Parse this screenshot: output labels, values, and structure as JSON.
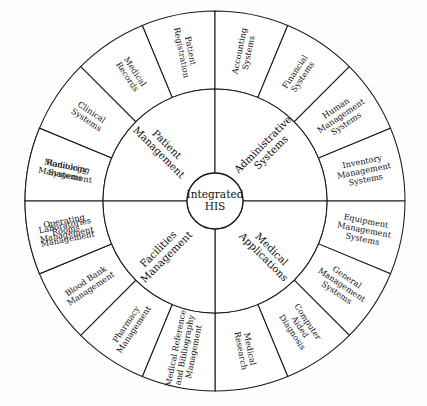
{
  "diagram": {
    "type": "radial-hierarchy-wheel",
    "hub": {
      "line1": "Integrated",
      "line2": "HIS"
    },
    "geometry": {
      "center_x": 215,
      "center_y": 201,
      "hub_radius": 28,
      "inner_ring_outer_radius": 112,
      "outer_ring_outer_radius": 190
    },
    "colors": {
      "stroke": "#1b1b1b",
      "fill": "#ffffff",
      "text": "#111111",
      "background": "#fdfdfc"
    },
    "inner_ring": [
      {
        "id": "patient-management",
        "label": "Patient Management",
        "lines": [
          "Patient",
          "Management"
        ],
        "start_angle": 180,
        "end_angle": 270
      },
      {
        "id": "administrative-systems",
        "label": "Administrative Systems",
        "lines": [
          "Administrative",
          "Systems"
        ],
        "start_angle": 270,
        "end_angle": 360
      },
      {
        "id": "medical-applications",
        "label": "Medical Applications",
        "lines": [
          "Medical",
          "Applications"
        ],
        "start_angle": 0,
        "end_angle": 90
      },
      {
        "id": "facilities-management",
        "label": "Facilities Management",
        "lines": [
          "Facilities",
          "Management"
        ],
        "start_angle": 90,
        "end_angle": 180
      }
    ],
    "outer_ring": [
      {
        "id": "patient-registration",
        "label": "Patient Registration",
        "lines": [
          "Patient",
          "Registration"
        ],
        "parent": "patient-management",
        "start_angle": 247.5,
        "end_angle": 270
      },
      {
        "id": "medical-records",
        "label": "Medical Records",
        "lines": [
          "Medical",
          "Records"
        ],
        "parent": "patient-management",
        "start_angle": 225,
        "end_angle": 247.5
      },
      {
        "id": "clinical-systems",
        "label": "Clinical Systems",
        "lines": [
          "Clinical",
          "Systems"
        ],
        "parent": "patient-management",
        "start_angle": 202.5,
        "end_angle": 225
      },
      {
        "id": "monitoring-systems",
        "label": "Monitoring Systems",
        "lines": [
          "Monitoring",
          "Systems"
        ],
        "parent": "patient-management",
        "start_angle": 180,
        "end_angle": 202.5
      },
      {
        "id": "accounting-systems",
        "label": "Accounting Systems",
        "lines": [
          "Accounting",
          "Systems"
        ],
        "parent": "administrative-systems",
        "start_angle": 270,
        "end_angle": 292.5
      },
      {
        "id": "financial-systems",
        "label": "Financial Systems",
        "lines": [
          "Financial",
          "Systems"
        ],
        "parent": "administrative-systems",
        "start_angle": 292.5,
        "end_angle": 315
      },
      {
        "id": "human-management-systems",
        "label": "Human Management Systems",
        "lines": [
          "Human",
          "Management",
          "Systems"
        ],
        "parent": "administrative-systems",
        "start_angle": 315,
        "end_angle": 337.5
      },
      {
        "id": "inventory-management-systems",
        "label": "Inventory Management Systems",
        "lines": [
          "Inventory",
          "Management",
          "Systems"
        ],
        "parent": "administrative-systems",
        "start_angle": 337.5,
        "end_angle": 360
      },
      {
        "id": "equipment-management-systems",
        "label": "Equipment Management Systems",
        "lines": [
          "Equipment",
          "Management",
          "Systems"
        ],
        "parent": "medical-applications",
        "start_angle": 0,
        "end_angle": 22.5
      },
      {
        "id": "general-management-systems",
        "label": "General Management Systems",
        "lines": [
          "General",
          "Management",
          "Systems"
        ],
        "parent": "medical-applications",
        "start_angle": 22.5,
        "end_angle": 45
      },
      {
        "id": "computer-aided-diagnosis",
        "label": "Computer Aided Diagnosis",
        "lines": [
          "Computer",
          "Aided",
          "Diagnosis"
        ],
        "parent": "medical-applications",
        "start_angle": 45,
        "end_angle": 67.5
      },
      {
        "id": "medical-research",
        "label": "Medical Research",
        "lines": [
          "Medical",
          "Research"
        ],
        "parent": "medical-applications",
        "start_angle": 67.5,
        "end_angle": 90
      },
      {
        "id": "medical-reference-and-bibliography-management",
        "label": "Medical Reference and Bibliography Management",
        "lines": [
          "Medical Reference",
          "and Bibliography",
          "Management"
        ],
        "parent": "medical-applications",
        "start_angle": 90,
        "end_angle": 112.5
      },
      {
        "id": "pharmacy-management",
        "label": "Pharmacy Management",
        "lines": [
          "Pharmacy",
          "Management"
        ],
        "parent": "facilities-management",
        "start_angle": 112.5,
        "end_angle": 135
      },
      {
        "id": "blood-bank-management",
        "label": "Blood Bank Management",
        "lines": [
          "Blood Bank",
          "Management"
        ],
        "parent": "facilities-management",
        "start_angle": 135,
        "end_angle": 157.5
      },
      {
        "id": "operating-rooms-management",
        "label": "Operating Rooms Management",
        "lines": [
          "Operating",
          "Rooms",
          "Management"
        ],
        "parent": "facilities-management",
        "start_angle": 157.5,
        "end_angle": 180
      },
      {
        "id": "radiology-management",
        "label": "Radiology Management",
        "lines": [
          "Radiology",
          "Management"
        ],
        "parent": "facilities-management",
        "start_angle": 180,
        "end_angle": 202.5
      },
      {
        "id": "laboratories-management",
        "label": "Laboratories Management",
        "lines": [
          "Laboratories",
          "Management"
        ],
        "parent": "patient-management",
        "start_angle": 157.5,
        "end_angle": 180
      }
    ]
  }
}
